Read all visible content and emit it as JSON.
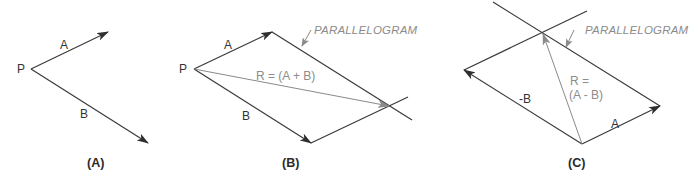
{
  "figure": {
    "panels": [
      {
        "id": "A",
        "caption": "(A)",
        "labels": {
          "origin": "P",
          "vec_a": "A",
          "vec_b": "B"
        }
      },
      {
        "id": "B",
        "caption": "(B)",
        "labels": {
          "origin": "P",
          "vec_a": "A",
          "vec_b": "B",
          "resultant": "R = (A + B)",
          "callout": "PARALLELOGRAM"
        }
      },
      {
        "id": "C",
        "caption": "(C)",
        "labels": {
          "vec_a": "A",
          "vec_neg_b": "-B",
          "resultant_line1": "R =",
          "resultant_line2": "(A - B)",
          "callout": "PARALLELOGRAM"
        }
      }
    ],
    "colors": {
      "line": "#3a3a3a",
      "resultant": "#8a8a8a",
      "annotation_text": "#8c8c8c",
      "text": "#333333"
    }
  }
}
